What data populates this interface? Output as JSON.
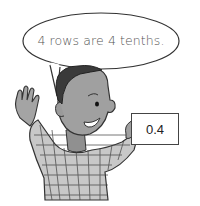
{
  "speech_bubble": {
    "text": "4 rows are 4 tenths."
  },
  "card": {
    "value": "0.4"
  },
  "character": {
    "description": "smiling boy in checkered shirt waving and holding a card"
  },
  "colors": {
    "outline": "#333333",
    "skin": "#9a9a9a",
    "hair": "#3a3a3a",
    "shirt": "#c8c8c8",
    "background": "#ffffff"
  }
}
